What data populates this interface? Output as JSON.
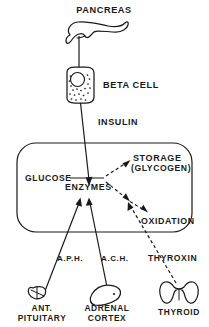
{
  "diagram": {
    "title_text": "PANCREAS",
    "ink_color": "#1a1a1a",
    "background_color": "#ffffff",
    "nodes": {
      "pancreas": {
        "label": "PANCREAS",
        "shape": "pancreas-organ"
      },
      "beta_cell": {
        "label": "BETA CELL",
        "shape": "rounded-cell-with-nucleus-and-granules"
      },
      "insulin": {
        "label": "INSULIN",
        "shape": "arrow-label"
      },
      "glucose": {
        "label": "GLUCOSE",
        "shape": "text-node"
      },
      "enzymes": {
        "label": "ENZYMES",
        "shape": "text-node"
      },
      "storage": {
        "label": "STORAGE",
        "shape": "text-node"
      },
      "glycogen": {
        "label": "(GLYCOGEN)",
        "shape": "text-node"
      },
      "oxidation": {
        "label": "OXIDATION",
        "shape": "text-node"
      },
      "aph": {
        "label": "A.P.H.",
        "shape": "pathway-label"
      },
      "ach": {
        "label": "A.C.H.",
        "shape": "pathway-label"
      },
      "thyroxin": {
        "label": "THYROXIN",
        "shape": "pathway-label"
      },
      "ant_pituitary_line1": {
        "label": "ANT.",
        "shape": "gland-label"
      },
      "ant_pituitary_line2": {
        "label": "PITUITARY",
        "shape": "gland-label"
      },
      "adrenal_line1": {
        "label": "ADRENAL",
        "shape": "gland-label"
      },
      "adrenal_line2": {
        "label": "CORTEX",
        "shape": "gland-label"
      },
      "thyroid": {
        "label": "THYROID",
        "shape": "gland-label"
      }
    },
    "icons": {
      "pancreas_icon": "pancreas-icon",
      "beta_cell_icon": "beta-cell-icon",
      "pituitary_icon": "pituitary-gland-icon",
      "adrenal_icon": "adrenal-cortex-icon",
      "thyroid_icon": "thyroid-gland-icon",
      "cell_boundary_icon": "cell-boundary-icon"
    },
    "connections": [
      {
        "from": "pancreas",
        "to": "beta_cell",
        "style": "solid",
        "label": ""
      },
      {
        "from": "beta_cell",
        "to": "enzymes",
        "style": "solid-arrow",
        "label": "INSULIN"
      },
      {
        "from": "glucose",
        "to": "enzymes",
        "style": "solid",
        "label": ""
      },
      {
        "from": "enzymes",
        "to": "storage",
        "style": "dashed-arrow",
        "label": ""
      },
      {
        "from": "enzymes",
        "to": "oxidation",
        "style": "dashed-arrow",
        "label": ""
      },
      {
        "from": "ant_pituitary",
        "to": "enzymes",
        "style": "solid-arrow",
        "label": "A.P.H."
      },
      {
        "from": "adrenal_cortex",
        "to": "enzymes",
        "style": "solid-arrow",
        "label": "A.C.H."
      },
      {
        "from": "thyroid",
        "to": "oxidation_pathway",
        "style": "dashed-arrow",
        "label": "THYROXIN"
      }
    ]
  }
}
